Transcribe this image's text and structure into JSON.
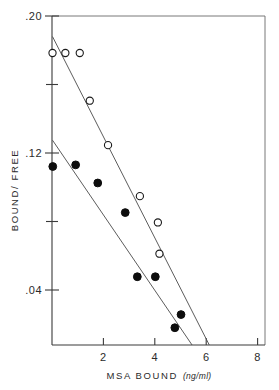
{
  "chart_data": {
    "type": "scatter",
    "title": "",
    "xlabel": "MSA BOUND",
    "xunit": "(ng/ml)",
    "ylabel": "BOUND/ FREE",
    "xlim": [
      0,
      8.6
    ],
    "ylim": [
      0,
      0.2
    ],
    "xticks": [
      2,
      4,
      6,
      8
    ],
    "xticklabels": [
      "2",
      "4",
      "6",
      "8"
    ],
    "yticks": [
      0.04,
      0.08,
      0.12,
      0.16,
      0.2
    ],
    "yticklabels": [
      ".04",
      "",
      ".12",
      "",
      ".20"
    ],
    "grid": false,
    "legend": "none",
    "series": [
      {
        "name": "open-circles",
        "marker": "open-circle",
        "points": [
          {
            "x": 0.02,
            "y": 0.1775
          },
          {
            "x": 0.52,
            "y": 0.1775
          },
          {
            "x": 1.08,
            "y": 0.1775
          },
          {
            "x": 1.47,
            "y": 0.1485
          },
          {
            "x": 2.18,
            "y": 0.1215
          },
          {
            "x": 3.42,
            "y": 0.0905
          },
          {
            "x": 4.12,
            "y": 0.0745
          },
          {
            "x": 4.18,
            "y": 0.0555
          }
        ],
        "fit_line": {
          "x0": 0.02,
          "y0": 0.1875,
          "x1": 6.12,
          "y1": 0.0
        }
      },
      {
        "name": "filled-circles",
        "marker": "filled-circle",
        "points": [
          {
            "x": 0.03,
            "y": 0.1085
          },
          {
            "x": 0.92,
            "y": 0.1095
          },
          {
            "x": 1.78,
            "y": 0.0985
          },
          {
            "x": 2.85,
            "y": 0.0805
          },
          {
            "x": 3.32,
            "y": 0.0415
          },
          {
            "x": 4.02,
            "y": 0.0415
          },
          {
            "x": 5.02,
            "y": 0.0185
          },
          {
            "x": 4.78,
            "y": 0.0105
          }
        ],
        "fit_line": {
          "x0": 0.02,
          "y0": 0.1245,
          "x1": 5.45,
          "y1": 0.0
        }
      }
    ]
  }
}
